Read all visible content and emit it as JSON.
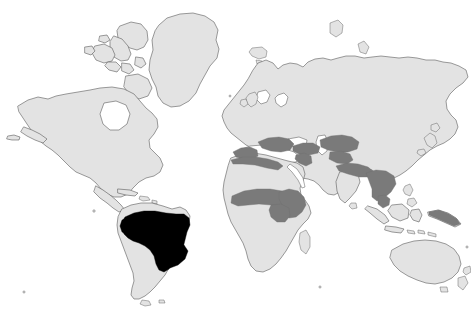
{
  "figure": {
    "kind": "world-distribution-map",
    "projection_style": "equirectangular",
    "width": 471,
    "height": 315,
    "background_color": "#ffffff",
    "has_border": false,
    "has_title_text": false,
    "has_legend": false,
    "has_axis_labels": false,
    "has_graticule": false,
    "title": "",
    "caption": ""
  },
  "styles": {
    "land_fill": "#e3e3e3",
    "land_outline": "#5a5a5a",
    "range_primary_fill": "#000000",
    "range_secondary_fill": "#7a7a7a",
    "ocean_fill": "#ffffff"
  },
  "map_data": {
    "type": "choropleth-range-map",
    "classes": [
      {
        "id": "range-primary",
        "label": "",
        "color": "#000000",
        "regions": [
          "Brazil",
          "eastern Peru",
          "Bolivia",
          "Paraguay",
          "northern Argentina",
          "Amazon basin"
        ]
      },
      {
        "id": "range-secondary",
        "label": "",
        "color": "#7a7a7a",
        "regions": [
          "Iberian Peninsula",
          "Mediterranean Europe",
          "North Africa",
          "Turkey",
          "Middle East",
          "Arabian Peninsula margin",
          "Iran",
          "Central Asia",
          "northern India",
          "Indochina",
          "Sahel",
          "Horn of Africa",
          "East Africa"
        ]
      },
      {
        "id": "land-unshaded",
        "label": "",
        "color": "#e3e3e3",
        "regions": [
          "North America",
          "Greenland",
          "Northern Europe",
          "Siberia",
          "China",
          "Japan",
          "Southern Africa",
          "Southern South America",
          "Australia",
          "New Zealand",
          "Indonesia",
          "Madagascar"
        ]
      }
    ],
    "continents_depicted": [
      "North America",
      "South America",
      "Europe",
      "Africa",
      "Asia",
      "Australia"
    ]
  }
}
